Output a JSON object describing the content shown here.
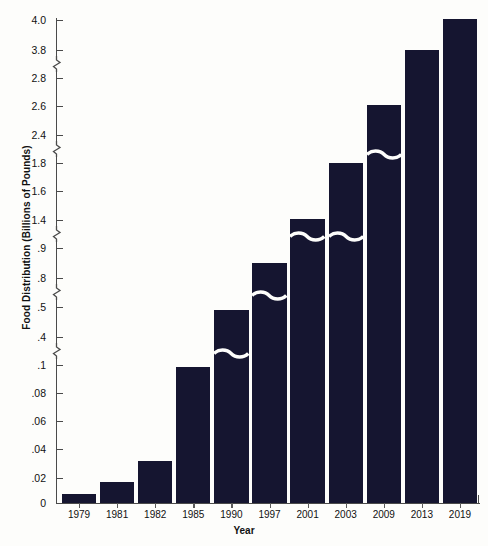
{
  "chart_data": {
    "type": "bar",
    "title": "",
    "xlabel": "Year",
    "ylabel": "Food Distribution (Billions of Pounds)",
    "categories": [
      "1979",
      "1981",
      "1982",
      "1985",
      "1990",
      "1997",
      "2001",
      "2003",
      "2009",
      "2013",
      "2019"
    ],
    "values": [
      0.005,
      0.017,
      0.032,
      0.095,
      0.48,
      0.87,
      1.4,
      1.8,
      2.6,
      3.8,
      4.0
    ],
    "bar_color": "#151530",
    "grid": false,
    "legend": null,
    "axis_broken": true,
    "ylim": [
      0,
      4.0
    ],
    "ytick_labels": [
      "0",
      ".02",
      ".04",
      ".06",
      ".08",
      ".1",
      ".4",
      ".5",
      ".8",
      ".9",
      "1.4",
      "1.6",
      "1.8",
      "2.4",
      "2.6",
      "2.8",
      "3.8",
      "4.0"
    ],
    "ytick_values": [
      0,
      0.02,
      0.04,
      0.06,
      0.08,
      0.1,
      0.4,
      0.5,
      0.8,
      0.9,
      1.4,
      1.6,
      1.8,
      2.4,
      2.6,
      2.8,
      3.8,
      4.0
    ],
    "axis_break_after_labels": [
      ".1",
      ".5",
      ".9",
      "1.8",
      "2.8"
    ]
  },
  "ticks": [
    {
      "label": "4.0",
      "y": 20
    },
    {
      "label": "3.8",
      "y": 50
    },
    {
      "label": "2.8",
      "y": 78
    },
    {
      "label": "2.6",
      "y": 106
    },
    {
      "label": "2.4",
      "y": 135
    },
    {
      "label": "1.8",
      "y": 163
    },
    {
      "label": "1.6",
      "y": 191
    },
    {
      "label": "1.4",
      "y": 220
    },
    {
      "label": ".9",
      "y": 248
    },
    {
      "label": ".8",
      "y": 278
    },
    {
      "label": ".5",
      "y": 307
    },
    {
      "label": ".4",
      "y": 337
    },
    {
      "label": ".1",
      "y": 365
    },
    {
      "label": ".08",
      "y": 393
    },
    {
      "label": ".06",
      "y": 421
    },
    {
      "label": ".04",
      "y": 449
    },
    {
      "label": ".02",
      "y": 478
    },
    {
      "label": "0",
      "y": 503
    }
  ],
  "axis_breaks": [
    {
      "y": 64
    },
    {
      "y": 149
    },
    {
      "y": 234
    },
    {
      "y": 292
    },
    {
      "y": 351
    }
  ],
  "bars": [
    {
      "year": "1979",
      "value": 0.005,
      "x": 60,
      "w": 38,
      "top": 494
    },
    {
      "year": "1981",
      "value": 0.017,
      "x": 101,
      "w": 38,
      "top": 482
    },
    {
      "year": "1982",
      "value": 0.032,
      "x": 142,
      "w": 38,
      "top": 461
    },
    {
      "year": "1985",
      "value": 0.095,
      "x": 183,
      "w": 38,
      "top": 367
    },
    {
      "year": "1990",
      "value": 0.48,
      "x": 224,
      "w": 38,
      "top": 310
    },
    {
      "year": "1997",
      "value": 0.87,
      "x": 265,
      "w": 38,
      "top": 263
    },
    {
      "year": "2001",
      "value": 1.4,
      "x": 306,
      "w": 38,
      "top": 219
    },
    {
      "year": "2003",
      "value": 1.8,
      "x": 347,
      "w": 38,
      "top": 163
    },
    {
      "year": "2009",
      "value": 2.6,
      "x": 388,
      "w": 38,
      "top": 105
    },
    {
      "year": "2013",
      "value": 3.8,
      "x": 429,
      "w": 38,
      "top": 50
    },
    {
      "year": "2019",
      "value": 4.0,
      "x": 441,
      "w": 38,
      "top": 19
    }
  ],
  "bar_breaks": [
    {
      "year": "1990",
      "y": 350
    },
    {
      "year": "1997",
      "y": 292
    },
    {
      "year": "2001",
      "y": 233
    },
    {
      "year": "2003",
      "y": 233
    },
    {
      "year": "2009",
      "y": 151
    }
  ]
}
